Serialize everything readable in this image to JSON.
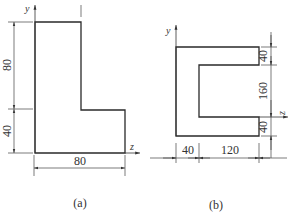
{
  "figures": [
    {
      "id": "a",
      "caption": "(a)",
      "shape": "L-section",
      "axes": {
        "y": "y",
        "z": "z"
      },
      "dimensions": {
        "upper_height": "80",
        "lower_height": "40",
        "total_width": "80"
      }
    },
    {
      "id": "b",
      "caption": "(b)",
      "shape": "C-section",
      "axes": {
        "y": "y",
        "z": "z"
      },
      "dimensions": {
        "top_flange": "40",
        "web_opening": "160",
        "bottom_flange": "40",
        "web_thickness": "40",
        "flange_length": "120"
      }
    }
  ]
}
